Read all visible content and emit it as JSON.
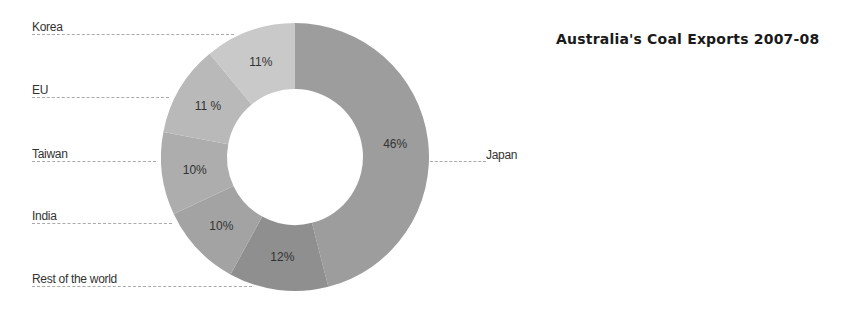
{
  "chart_data": {
    "type": "pie",
    "subtype": "donut",
    "title": "Australia's Coal Exports 2007-08",
    "categories": [
      "Japan",
      "Rest of the world",
      "India",
      "Taiwan",
      "EU",
      "Korea"
    ],
    "values": [
      46,
      12,
      10,
      10,
      11,
      11
    ],
    "value_labels": [
      "46%",
      "12%",
      "10%",
      "10%",
      "11 %",
      "11%"
    ],
    "colors": [
      "#9d9d9d",
      "#8f8f8f",
      "#a3a3a3",
      "#adadad",
      "#b9b9b9",
      "#c9c9c9"
    ],
    "legend": "leader-line labels",
    "unit": "%"
  },
  "labels": {
    "korea": "Korea",
    "eu": "EU",
    "taiwan": "Taiwan",
    "india": "India",
    "rest": "Rest of the world",
    "japan": "Japan"
  }
}
